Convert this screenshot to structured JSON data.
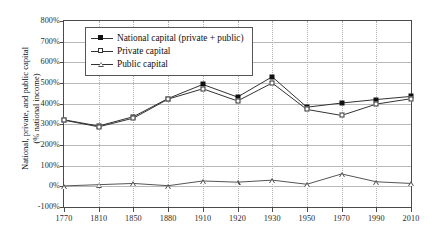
{
  "chart_data": {
    "type": "line",
    "title": "",
    "xlabel": "",
    "ylabel": "National, private, and public capital\n(% national income)",
    "categories": [
      "1770",
      "1810",
      "1850",
      "1880",
      "1910",
      "1920",
      "1930",
      "1950",
      "1970",
      "1990",
      "2010"
    ],
    "ylim": [
      -100,
      800
    ],
    "ytick_step": 100,
    "ytick_labels": [
      "800%",
      "700%",
      "600%",
      "500%",
      "400%",
      "300%",
      "200%",
      "100%",
      "0%",
      "-100%"
    ],
    "ytick_values": [
      800,
      700,
      600,
      500,
      400,
      300,
      200,
      100,
      0,
      -100
    ],
    "grid": true,
    "legend_position": "top-left-inside",
    "series": [
      {
        "name": "National capital (private + public)",
        "marker": "filled-square",
        "values": [
          322,
          292,
          337,
          425,
          493,
          432,
          530,
          383,
          403,
          420,
          435
        ]
      },
      {
        "name": "Private capital",
        "marker": "open-square",
        "values": [
          320,
          288,
          330,
          422,
          472,
          413,
          500,
          372,
          343,
          398,
          424
        ]
      },
      {
        "name": "Public capital",
        "marker": "open-triangle",
        "values": [
          2,
          8,
          14,
          3,
          26,
          20,
          30,
          10,
          60,
          22,
          14
        ]
      }
    ]
  },
  "axis": {
    "y_title_line1": "National, private, and public capital",
    "y_title_line2": "(% national income)"
  }
}
